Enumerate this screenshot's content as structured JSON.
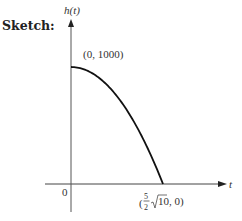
{
  "heading": "Sketch:",
  "chart_data": {
    "type": "line",
    "title": "",
    "function": "h(t) = 1000 - 16t^2",
    "xlabel": "t",
    "ylabel": "h(t)",
    "origin_label": "0",
    "xlim": [
      0,
      7.906
    ],
    "ylim": [
      0,
      1000
    ],
    "grid": false,
    "series": [
      {
        "name": "h(t)",
        "x": [
          0,
          1,
          2,
          3,
          4,
          5,
          6,
          7,
          7.906
        ],
        "y": [
          1000,
          984,
          936,
          856,
          744,
          600,
          424,
          216,
          0
        ]
      }
    ],
    "annotations": [
      {
        "label": "(0, 1000)",
        "x": 0,
        "y": 1000
      },
      {
        "label_prefix": "(",
        "frac_num": "5",
        "frac_den": "2",
        "radical": "10",
        "label_suffix": ", 0)",
        "x": 7.906,
        "y": 0
      }
    ]
  }
}
